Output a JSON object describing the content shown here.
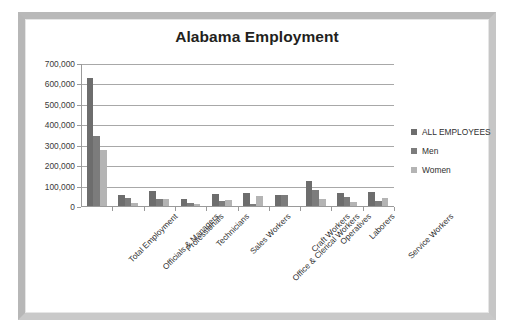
{
  "frame": {
    "border_color": "#bdbdbd",
    "background": "#ffffff"
  },
  "chart_data": {
    "type": "bar",
    "title": "Alabama Employment",
    "xlabel": "",
    "ylabel": "",
    "ylim": [
      0,
      700000
    ],
    "ytick_labels": [
      "0",
      "100,000",
      "200,000",
      "300,000",
      "400,000",
      "500,000",
      "600,000",
      "700,000"
    ],
    "ytick_values": [
      0,
      100000,
      200000,
      300000,
      400000,
      500000,
      600000,
      700000
    ],
    "grid": true,
    "legend_position": "right",
    "categories": [
      "Total Employment",
      "Officials & Managers",
      "Professionals",
      "Technicians",
      "Sales Workers",
      "Office & Clerical Workers",
      "Craft Workers",
      "Operatives",
      "Laborers",
      "Service Workers"
    ],
    "series": [
      {
        "name": "ALL EMPLOYEES",
        "color": "#6d6d6d",
        "values": [
          630000,
          60000,
          78000,
          38000,
          62000,
          68000,
          61000,
          125000,
          71000,
          74000
        ]
      },
      {
        "name": "Men",
        "color": "#7c7c7c",
        "values": [
          350000,
          42000,
          40000,
          22000,
          30000,
          13000,
          58000,
          85000,
          49000,
          30000
        ]
      },
      {
        "name": "Women",
        "color": "#b4b4b4",
        "values": [
          280000,
          18000,
          39000,
          17000,
          33000,
          55000,
          4000,
          40000,
          23000,
          45000
        ]
      }
    ]
  },
  "legend": {
    "items": [
      {
        "label": "ALL EMPLOYEES",
        "color": "#6d6d6d"
      },
      {
        "label": "Men",
        "color": "#7c7c7c"
      },
      {
        "label": "Women",
        "color": "#b4b4b4"
      }
    ]
  }
}
